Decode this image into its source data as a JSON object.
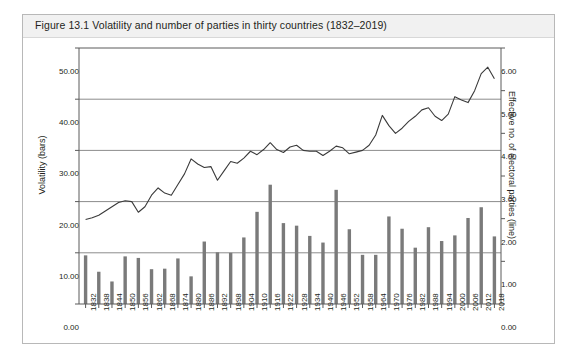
{
  "figure": {
    "caption": "Figure 13.1  Volatility and number of parties in thirty countries (1832–2019)"
  },
  "chart_data": {
    "type": "bar",
    "title": "Volatility and number of parties in thirty countries (1832–2019)",
    "xlabel": "",
    "ylabel": "Volatility (bars)",
    "y2label": "Effective no. of electoral parties (line)",
    "ylim": [
      0,
      50
    ],
    "y2lim": [
      0,
      6
    ],
    "yticks": [
      "0.00",
      "10.00",
      "20.00",
      "30.00",
      "40.00",
      "50.00"
    ],
    "y2ticks": [
      "0.00",
      "1.00",
      "2.00",
      "3.00",
      "4.00",
      "5.00",
      "6.00"
    ],
    "grid": true,
    "legend": "none",
    "bar_color": "#7a7a7a",
    "line_color": "#3a3a3a",
    "categories": [
      "1832",
      "1838",
      "1844",
      "1850",
      "1856",
      "1862",
      "1868",
      "1874",
      "1880",
      "1886",
      "1892",
      "1898",
      "1904",
      "1910",
      "1916",
      "1922",
      "1928",
      "1934",
      "1940",
      "1946",
      "1952",
      "1958",
      "1964",
      "1970",
      "1976",
      "1982",
      "1988",
      "1994",
      "2000",
      "2006",
      "2012",
      "2018"
    ],
    "series": [
      {
        "name": "Volatility (bars)",
        "axis": "left",
        "type": "bar",
        "values": [
          9.5,
          6.3,
          4.4,
          9.3,
          9.0,
          6.8,
          6.9,
          8.9,
          5.4,
          12.2,
          10.1,
          10.0,
          13.0,
          18.0,
          23.3,
          15.8,
          15.3,
          13.3,
          12.0,
          22.3,
          14.6,
          9.6,
          9.6,
          17.1,
          14.7,
          11.0,
          15.0,
          12.3,
          13.4,
          16.8,
          18.9,
          13.2
        ]
      },
      {
        "name": "Effective no. of electoral parties (line)",
        "axis": "right",
        "type": "line",
        "x": [
          "1832",
          "1835",
          "1838",
          "1841",
          "1844",
          "1847",
          "1850",
          "1853",
          "1856",
          "1859",
          "1862",
          "1865",
          "1868",
          "1871",
          "1874",
          "1877",
          "1880",
          "1883",
          "1886",
          "1889",
          "1892",
          "1895",
          "1898",
          "1901",
          "1904",
          "1907",
          "1910",
          "1913",
          "1916",
          "1919",
          "1922",
          "1925",
          "1928",
          "1931",
          "1934",
          "1937",
          "1940",
          "1943",
          "1946",
          "1949",
          "1952",
          "1955",
          "1958",
          "1961",
          "1964",
          "1967",
          "1970",
          "1973",
          "1976",
          "1979",
          "1982",
          "1985",
          "1988",
          "1991",
          "1994",
          "1997",
          "2000",
          "2003",
          "2006",
          "2009",
          "2012",
          "2015",
          "2018"
        ],
        "values": [
          1.98,
          2.02,
          2.08,
          2.18,
          2.28,
          2.38,
          2.42,
          2.4,
          2.15,
          2.28,
          2.55,
          2.72,
          2.6,
          2.55,
          2.8,
          3.05,
          3.4,
          3.28,
          3.2,
          3.22,
          2.9,
          3.12,
          3.34,
          3.3,
          3.42,
          3.58,
          3.5,
          3.62,
          3.78,
          3.62,
          3.55,
          3.68,
          3.72,
          3.6,
          3.58,
          3.58,
          3.48,
          3.58,
          3.7,
          3.66,
          3.52,
          3.56,
          3.6,
          3.72,
          3.96,
          4.42,
          4.18,
          4.0,
          4.12,
          4.28,
          4.4,
          4.55,
          4.6,
          4.4,
          4.3,
          4.45,
          4.86,
          4.78,
          4.72,
          5.0,
          5.4,
          5.55,
          5.28
        ]
      }
    ]
  }
}
